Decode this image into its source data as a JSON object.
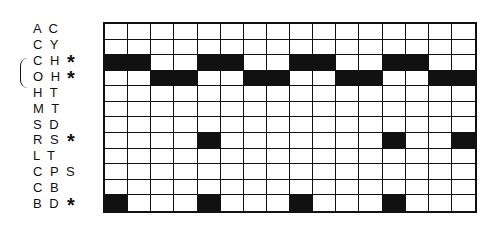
{
  "diagram": {
    "columns": 16,
    "rows": [
      {
        "code": "AC",
        "starred": false,
        "filled": []
      },
      {
        "code": "CY",
        "starred": false,
        "filled": []
      },
      {
        "code": "CH",
        "starred": true,
        "filled": [
          0,
          1,
          4,
          5,
          8,
          9,
          12,
          13
        ]
      },
      {
        "code": "OH",
        "starred": true,
        "filled": [
          2,
          3,
          6,
          7,
          10,
          11,
          14,
          15
        ]
      },
      {
        "code": "HT",
        "starred": false,
        "filled": []
      },
      {
        "code": "MT",
        "starred": false,
        "filled": []
      },
      {
        "code": "SD",
        "starred": false,
        "filled": []
      },
      {
        "code": "RS",
        "starred": true,
        "filled": [
          4,
          12,
          15
        ]
      },
      {
        "code": "LT",
        "starred": false,
        "filled": []
      },
      {
        "code": "CPS",
        "starred": false,
        "filled": []
      },
      {
        "code": "CB",
        "starred": false,
        "filled": []
      },
      {
        "code": "BD",
        "starred": true,
        "filled": [
          0,
          4,
          8,
          12
        ]
      }
    ],
    "star_symbol": "*",
    "bracket_groups": [
      [
        "CH",
        "OH"
      ]
    ],
    "fill_color": "#111111",
    "empty_color": "#ffffff"
  }
}
